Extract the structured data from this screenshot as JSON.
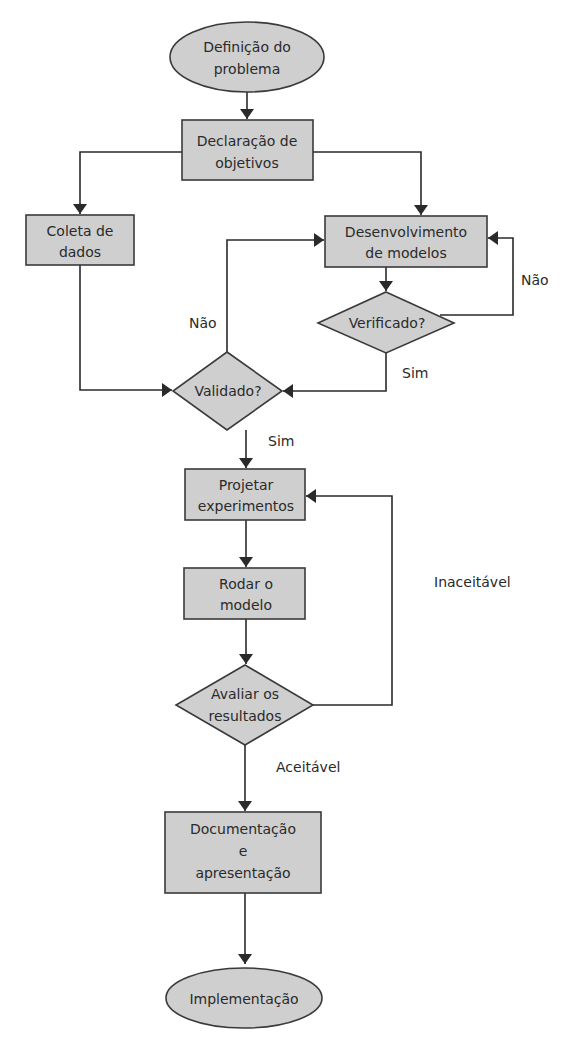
{
  "diagram": {
    "type": "flowchart",
    "colors": {
      "node_fill": "#cfcfcf",
      "stroke": "#2a2a2a",
      "background": "#ffffff"
    },
    "nodes": {
      "definicao": {
        "shape": "ellipse",
        "lines": [
          "Definição do",
          "problema"
        ]
      },
      "declaracao": {
        "shape": "rect",
        "lines": [
          "Declaração de",
          "objetivos"
        ]
      },
      "coleta": {
        "shape": "rect",
        "lines": [
          "Coleta de",
          "dados"
        ]
      },
      "desenvolvimento": {
        "shape": "rect",
        "lines": [
          "Desenvolvimento",
          "de modelos"
        ]
      },
      "verificado": {
        "shape": "diamond",
        "lines": [
          "Verificado?"
        ]
      },
      "validado": {
        "shape": "diamond",
        "lines": [
          "Validado?"
        ]
      },
      "projetar": {
        "shape": "rect",
        "lines": [
          "Projetar",
          "experimentos"
        ]
      },
      "rodar": {
        "shape": "rect",
        "lines": [
          "Rodar o",
          "modelo"
        ]
      },
      "avaliar": {
        "shape": "diamond",
        "lines": [
          "Avaliar os",
          "resultados"
        ]
      },
      "documentacao": {
        "shape": "rect",
        "lines": [
          "Documentação",
          "e",
          "apresentação"
        ]
      },
      "implementacao": {
        "shape": "ellipse",
        "lines": [
          "Implementação"
        ]
      }
    },
    "edge_labels": {
      "verificado_nao": "Não",
      "verificado_sim": "Sim",
      "validado_nao": "Não",
      "validado_sim": "Sim",
      "avaliar_inaceitavel": "Inaceitável",
      "avaliar_aceitavel": "Aceitável"
    },
    "edges": [
      {
        "from": "definicao",
        "to": "declaracao"
      },
      {
        "from": "declaracao",
        "to": "coleta"
      },
      {
        "from": "declaracao",
        "to": "desenvolvimento"
      },
      {
        "from": "desenvolvimento",
        "to": "verificado"
      },
      {
        "from": "verificado",
        "to": "desenvolvimento",
        "label": "Não"
      },
      {
        "from": "verificado",
        "to": "validado",
        "label": "Sim"
      },
      {
        "from": "coleta",
        "to": "validado"
      },
      {
        "from": "validado",
        "to": "desenvolvimento",
        "label": "Não"
      },
      {
        "from": "validado",
        "to": "projetar",
        "label": "Sim"
      },
      {
        "from": "projetar",
        "to": "rodar"
      },
      {
        "from": "rodar",
        "to": "avaliar"
      },
      {
        "from": "avaliar",
        "to": "projetar",
        "label": "Inaceitável"
      },
      {
        "from": "avaliar",
        "to": "documentacao",
        "label": "Aceitável"
      },
      {
        "from": "documentacao",
        "to": "implementacao"
      }
    ]
  }
}
